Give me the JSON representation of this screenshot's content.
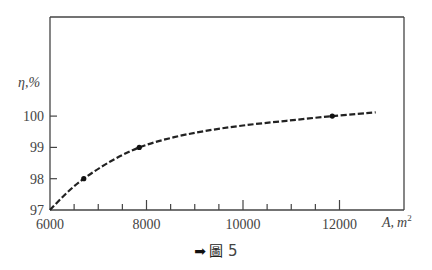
{
  "chart_data": {
    "type": "line",
    "title": "",
    "xlabel": "A, m²",
    "ylabel": "η,%",
    "xlim": [
      6000,
      13300
    ],
    "ylim": [
      97,
      102
    ],
    "x_ticks_major": [
      6000,
      8000,
      10000,
      12000
    ],
    "x_ticks_minor": [
      6500,
      7000,
      7500,
      8500,
      9000,
      9500,
      10500,
      11000,
      11500
    ],
    "y_ticks": [
      97,
      98,
      99,
      100
    ],
    "grid": false,
    "legend": null,
    "line_style": "dashed",
    "series": [
      {
        "name": "efficiency",
        "x": [
          6000,
          6350,
          6700,
          7250,
          7850,
          8500,
          9200,
          10000,
          10900,
          11850,
          12750
        ],
        "y": [
          97.0,
          97.55,
          98.0,
          98.55,
          99.0,
          99.3,
          99.52,
          99.7,
          99.85,
          100.0,
          100.12
        ]
      }
    ],
    "markers": [
      {
        "x": 6700,
        "y": 98
      },
      {
        "x": 7850,
        "y": 99
      },
      {
        "x": 11850,
        "y": 100
      }
    ]
  },
  "labels": {
    "y_axis": "η,%",
    "x_axis_var": "A,",
    "x_axis_unit": "m",
    "x_axis_sup": "2",
    "y_tick_labels": [
      "97",
      "98",
      "99",
      "100"
    ],
    "x_tick_labels": [
      "6000",
      "8000",
      "10000",
      "12000"
    ]
  },
  "caption": {
    "arrow": "➡",
    "char": "圖",
    "number": "5"
  }
}
